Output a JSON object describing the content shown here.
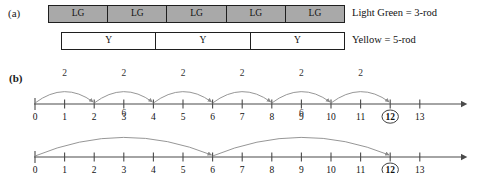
{
  "figure": {
    "panel_a_label": "(a)",
    "panel_b_label": "(b)"
  },
  "rods": {
    "light_green": {
      "cells": [
        "LG",
        "LG",
        "LG",
        "LG",
        "LG"
      ],
      "legend": "Light Green = 3-rod",
      "fill_color": "#a9a9a9"
    },
    "yellow": {
      "cells": [
        "Y",
        "Y",
        "Y"
      ],
      "legend": "Yellow = 5-rod",
      "fill_color": "#ffffff"
    }
  },
  "chart_data": [
    {
      "type": "line",
      "name": "number-line-twos",
      "title": "",
      "xlabel": "",
      "ylabel": "",
      "xlim": [
        0,
        13
      ],
      "tick_values": [
        0,
        1,
        2,
        3,
        4,
        5,
        6,
        7,
        8,
        9,
        10,
        11,
        12,
        13
      ],
      "tick_labels": [
        "0",
        "1",
        "2",
        "3",
        "4",
        "5",
        "6",
        "7",
        "8",
        "9",
        "10",
        "11",
        "12",
        "13"
      ],
      "highlighted_ticks": [
        12
      ],
      "grid": false,
      "legend": "none",
      "hops": [
        {
          "from": 0,
          "to": 2,
          "label": "2"
        },
        {
          "from": 2,
          "to": 4,
          "label": "2"
        },
        {
          "from": 4,
          "to": 6,
          "label": "2"
        },
        {
          "from": 6,
          "to": 8,
          "label": "2"
        },
        {
          "from": 8,
          "to": 10,
          "label": "2"
        },
        {
          "from": 10,
          "to": 12,
          "label": "2"
        }
      ]
    },
    {
      "type": "line",
      "name": "number-line-sixes",
      "title": "",
      "xlabel": "",
      "ylabel": "",
      "xlim": [
        0,
        13
      ],
      "tick_values": [
        0,
        1,
        2,
        3,
        4,
        5,
        6,
        7,
        8,
        9,
        10,
        11,
        12,
        13
      ],
      "tick_labels": [
        "0",
        "1",
        "2",
        "3",
        "4",
        "5",
        "6",
        "7",
        "8",
        "9",
        "10",
        "11",
        "12",
        "13"
      ],
      "highlighted_ticks": [
        12
      ],
      "grid": false,
      "legend": "none",
      "hops": [
        {
          "from": 0,
          "to": 6,
          "label": "6"
        },
        {
          "from": 6,
          "to": 12,
          "label": "6"
        }
      ]
    }
  ]
}
